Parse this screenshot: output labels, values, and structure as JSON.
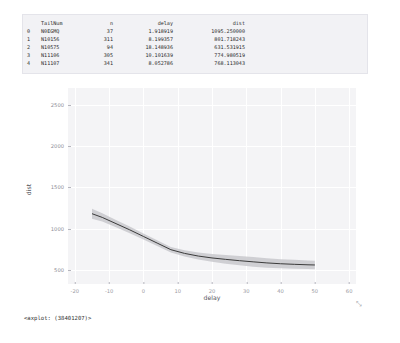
{
  "dataframe": {
    "columns": [
      "",
      "TailNum",
      "n",
      "delay",
      "dist"
    ],
    "rows": [
      {
        "idx": "0",
        "tailnum": "N0EGMQ",
        "n": "37",
        "delay": "1.918919",
        "dist": "1095.250000"
      },
      {
        "idx": "1",
        "tailnum": "N10156",
        "n": "311",
        "delay": "8.199357",
        "dist": "801.718243"
      },
      {
        "idx": "2",
        "tailnum": "N10575",
        "n": "94",
        "delay": "18.148936",
        "dist": "631.531915"
      },
      {
        "idx": "3",
        "tailnum": "N11106",
        "n": "305",
        "delay": "10.101639",
        "dist": "774.980519"
      },
      {
        "idx": "4",
        "tailnum": "N11107",
        "n": "341",
        "delay": "8.052786",
        "dist": "768.113043"
      }
    ]
  },
  "repr": "<axplot: (38401207)>",
  "resize_glyph": "⤡",
  "chart_data": {
    "type": "line",
    "title": "",
    "xlabel": "delay",
    "ylabel": "dist",
    "xlim": [
      -22,
      62
    ],
    "ylim": [
      330,
      2700
    ],
    "xticks": [
      -20,
      -10,
      0,
      10,
      20,
      30,
      40,
      50,
      60
    ],
    "xticklabels": [
      "-20",
      "-10",
      "0",
      "10",
      "20",
      "30",
      "40",
      "50",
      "60"
    ],
    "yticks": [
      500,
      1000,
      1500,
      2000,
      2500
    ],
    "yticklabels": [
      "500",
      "1000",
      "1500",
      "2000",
      "2500"
    ],
    "grid": true,
    "legend": null,
    "band_label": "95% CI",
    "line_color": "#3b3b3b",
    "band_color": "#c8c8cc",
    "axes_facecolor": "#f4f4f6",
    "grid_color": "#ffffff",
    "series": [
      {
        "name": "dist",
        "x": [
          -15,
          -12,
          -8,
          -4,
          0,
          4,
          8,
          12,
          16,
          20,
          24,
          28,
          32,
          36,
          40,
          44,
          48,
          50
        ],
        "y": [
          1180,
          1135,
          1060,
          985,
          905,
          825,
          745,
          700,
          668,
          645,
          628,
          612,
          598,
          585,
          575,
          568,
          562,
          560
        ],
        "ci_lower": [
          1120,
          1085,
          1015,
          945,
          868,
          790,
          712,
          662,
          625,
          598,
          575,
          556,
          540,
          528,
          520,
          514,
          510,
          508
        ],
        "ci_upper": [
          1240,
          1185,
          1105,
          1025,
          942,
          860,
          778,
          738,
          711,
          692,
          681,
          668,
          656,
          642,
          630,
          622,
          614,
          612
        ]
      }
    ]
  }
}
